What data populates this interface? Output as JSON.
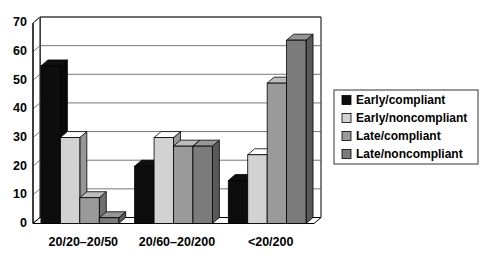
{
  "chart_data": {
    "type": "bar",
    "title": "",
    "subtitle": "",
    "xlabel": "",
    "ylabel": "",
    "ylim": [
      0,
      70
    ],
    "ytick_step": 10,
    "yticks": [
      0,
      10,
      20,
      30,
      40,
      50,
      60,
      70
    ],
    "grid": true,
    "three_d": true,
    "legend_position": "right",
    "categories": [
      "20/20–20/50",
      "20/60–20/200",
      "<20/200"
    ],
    "series": [
      {
        "name": "Early/compliant",
        "color": "#0d0d0d",
        "values": [
          55,
          20,
          15
        ]
      },
      {
        "name": "Early/noncompliant",
        "color": "#d2d2d2",
        "values": [
          30,
          30,
          24
        ]
      },
      {
        "name": "Late/compliant",
        "color": "#9a9a9a",
        "values": [
          9,
          27,
          49
        ]
      },
      {
        "name": "Late/noncompliant",
        "color": "#7b7b7b",
        "values": [
          2,
          27,
          64
        ]
      }
    ]
  },
  "legend": {
    "items": [
      {
        "label": "Early/compliant",
        "swatch": "#0d0d0d"
      },
      {
        "label": "Early/noncompliant",
        "swatch": "#d2d2d2"
      },
      {
        "label": "Late/compliant",
        "swatch": "#9a9a9a"
      },
      {
        "label": "Late/noncompliant",
        "swatch": "#7b7b7b"
      }
    ]
  },
  "colors": {
    "background": "#ffffff",
    "axis": "#000000",
    "gridline": "#555555",
    "plot_floor": "#9a9a9a",
    "plot_wall": "#c9c9c9"
  }
}
